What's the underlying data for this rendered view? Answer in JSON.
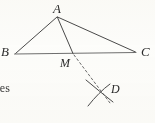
{
  "figure": {
    "type": "geometry-diagram",
    "background_color": "#fdfdfb",
    "stroke_color": "#4a4a4a",
    "dashed_stroke_color": "#6b6b6b",
    "label_color": "#2b2b2b",
    "points": [
      {
        "name": "A",
        "label": "A",
        "x": 57,
        "y": 16,
        "label_x": 53,
        "label_y": 2,
        "role": "apex-vertex"
      },
      {
        "name": "B",
        "label": "B",
        "x": 15,
        "y": 54,
        "label_x": 1,
        "label_y": 45,
        "role": "left-vertex"
      },
      {
        "name": "C",
        "label": "C",
        "x": 136,
        "y": 52,
        "label_x": 141,
        "label_y": 45,
        "role": "right-vertex"
      },
      {
        "name": "M",
        "label": "M",
        "x": 73,
        "y": 54,
        "label_x": 60,
        "label_y": 57,
        "role": "point-on-base"
      },
      {
        "name": "D",
        "label": "D",
        "x": 100,
        "y": 92,
        "label_x": 111,
        "label_y": 83,
        "role": "arc-intersection"
      }
    ],
    "segments": [
      {
        "name": "AB",
        "from": "A",
        "to": "B",
        "style": "solid"
      },
      {
        "name": "AC",
        "from": "A",
        "to": "C",
        "style": "solid"
      },
      {
        "name": "BC",
        "from": "B",
        "to": "C",
        "style": "solid"
      },
      {
        "name": "AM",
        "from": "A",
        "to": "M",
        "style": "solid"
      },
      {
        "name": "MD",
        "from": "M",
        "to": "D",
        "style": "dashed"
      }
    ],
    "arcs": [
      {
        "name": "arc-1",
        "description": "construction arc sweeping down-right through D"
      },
      {
        "name": "arc-2",
        "description": "construction arc sweeping down-left through D"
      }
    ]
  },
  "text": {
    "body_fragment": "ces"
  }
}
